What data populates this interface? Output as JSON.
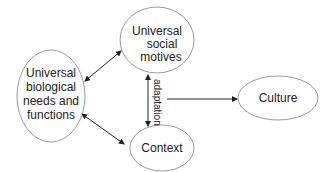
{
  "diagram": {
    "nodes": [
      {
        "id": "bio",
        "lines": [
          "Universal",
          "biological",
          "needs and",
          "functions"
        ]
      },
      {
        "id": "social",
        "lines": [
          "Universal",
          "social",
          "motives"
        ]
      },
      {
        "id": "context",
        "lines": [
          "Context"
        ]
      },
      {
        "id": "culture",
        "lines": [
          "Culture"
        ]
      }
    ],
    "edges": [
      {
        "from": "bio",
        "to": "social",
        "type": "bidirectional"
      },
      {
        "from": "bio",
        "to": "context",
        "type": "bidirectional"
      },
      {
        "from": "social",
        "to": "context",
        "type": "bidirectional",
        "label": "adaptation"
      },
      {
        "from": "adaptation",
        "to": "culture",
        "type": "directed"
      }
    ],
    "colors": {
      "stroke": "#9a9a9a",
      "arrow": "#222222",
      "text": "#222222"
    }
  }
}
